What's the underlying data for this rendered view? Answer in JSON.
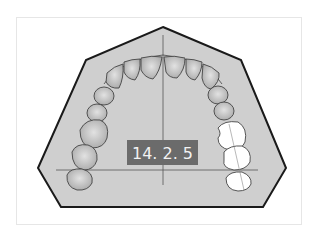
{
  "diagram": {
    "label": "14. 2. 5",
    "colors": {
      "base_fill": "#cfcfcf",
      "outline": "#1a1a1a",
      "tooth_fill": "#bdbdbd",
      "tooth_stroke": "#555555",
      "highlight_tooth_fill": "#ffffff",
      "label_bg": "#6b6b6b",
      "label_text": "#f2f2f2",
      "axis_line": "#555555"
    },
    "highlighted_teeth": [
      "right-second-premolar-or-molars",
      "right-first-molar",
      "right-second-molar"
    ]
  }
}
